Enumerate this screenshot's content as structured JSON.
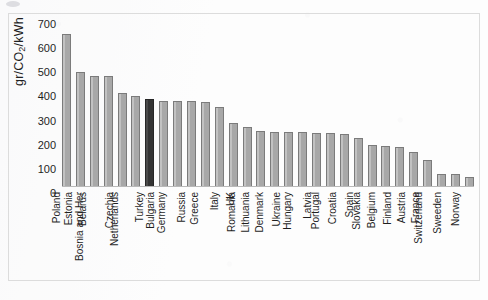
{
  "chart_data": {
    "type": "bar",
    "title": "",
    "subtitle": "",
    "xlabel": "",
    "ylabel": "gr/CO2/kWh",
    "ylabel_parts": {
      "prefix": "gr/CO",
      "subscript": "2",
      "suffix": "/kWh"
    },
    "ylim": [
      0,
      700
    ],
    "yticks": [
      0,
      100,
      200,
      300,
      400,
      500,
      600,
      700
    ],
    "ytick_labels": [
      "0",
      "100",
      "200",
      "300",
      "400",
      "500",
      "600",
      "700"
    ],
    "grid": false,
    "legend": "none",
    "highlight_category": "Turkey",
    "colors": {
      "bar": "#a9a9a9",
      "bar_edge": "#7b7b7b",
      "highlight_bar": "#3a3a3a",
      "highlight_bar_edge": "#262626",
      "axis": "#b9b9b9",
      "frame": "#dcdcdc",
      "text": "#1f1f1f",
      "background": "#fdfdfd"
    },
    "categories": [
      "Poland",
      "Estonia",
      "Belarus",
      "Bosnia and Her",
      "Czechia",
      "Netherlands",
      "Turkey",
      "Bulgaria",
      "Germany",
      "Russia",
      "Greece",
      "Italy",
      "UK",
      "Romania",
      "Lithuania",
      "Denmark",
      "Ukraine",
      "Hungary",
      "Latvia",
      "Portugal",
      "Croatia",
      "Spain",
      "Slovakia",
      "Belgium",
      "Finland",
      "Austria",
      "France",
      "Switzerland",
      "Sweeden",
      "Norway"
    ],
    "values": [
      655,
      495,
      478,
      475,
      405,
      392,
      380,
      370,
      369,
      368,
      367,
      345,
      273,
      258,
      240,
      238,
      236,
      235,
      234,
      232,
      228,
      212,
      180,
      178,
      172,
      152,
      115,
      58,
      55,
      42
    ],
    "value_unit": "gr/CO2/kWh"
  }
}
